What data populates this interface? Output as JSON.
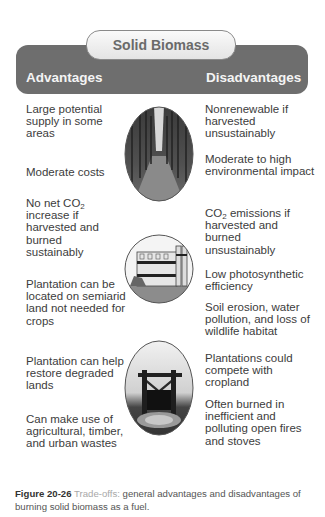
{
  "title": "Solid Biomass",
  "headers": {
    "advantages": "Advantages",
    "disadvantages": "Disadvantages"
  },
  "advantages": [
    "Large potential supply in some areas",
    "Moderate costs",
    "No net CO2 increase if harvested and burned sustainably",
    "Plantation can be located on semiarid land not needed for crops",
    "Plantation can help restore degraded lands",
    "Can make use of agricultural, timber, and urban wastes"
  ],
  "disadvantages": [
    "Nonrenewable if harvested unsustainably",
    "Moderate to high environmental impact",
    "CO2 emissions if harvested and burned unsustainably",
    "Low photosynthetic efficiency",
    "Soil erosion, water pollution, and loss of wildlife habitat",
    "Plantations could compete with cropland",
    "Often burned in inefficient and polluting open fires and stoves"
  ],
  "images": [
    {
      "name": "tree-plantation-image",
      "shape": "oval"
    },
    {
      "name": "biomass-power-plant-image",
      "shape": "circle"
    },
    {
      "name": "open-fire-cooking-image",
      "shape": "oval"
    }
  ],
  "caption": {
    "figure": "Figure 20-26",
    "label": "Trade-offs:",
    "text": "general advantages and disadvantages of burning solid biomass as a fuel."
  },
  "colors": {
    "banner": "#6e6e6e",
    "pill": "#ececec",
    "text": "#3c3c3c",
    "caption_label": "#a8a8a8"
  }
}
